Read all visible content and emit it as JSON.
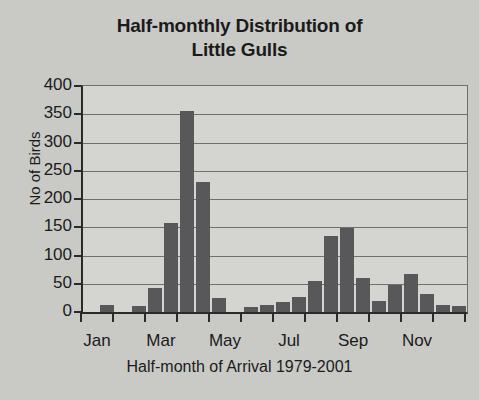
{
  "chart_data": {
    "type": "bar",
    "title": "Half-monthly Distribution of Little Gulls",
    "title_lines": [
      "Half-monthly Distribution of",
      "Little Gulls"
    ],
    "xlabel": "Half-month of Arrival 1979-2001",
    "ylabel": "No of Birds",
    "ylim": [
      0,
      400
    ],
    "ytick_labels": [
      "400",
      "350",
      "300",
      "250",
      "200",
      "150",
      "100",
      "50",
      "0"
    ],
    "ytick_values": [
      400,
      350,
      300,
      250,
      200,
      150,
      100,
      50,
      0
    ],
    "xtick_labels": [
      "Jan",
      "Mar",
      "May",
      "Jul",
      "Sep",
      "Nov"
    ],
    "xtick_months": [
      1,
      3,
      5,
      7,
      9,
      11
    ],
    "grid": true,
    "legend": null,
    "bar_color": "#58585a",
    "plot_background": "#d4d5d1",
    "figure_background": "#c9cac6",
    "axis_color": "#2a2a2a",
    "categories": [
      "Jan-1",
      "Jan-2",
      "Feb-1",
      "Feb-2",
      "Mar-1",
      "Mar-2",
      "Apr-1",
      "Apr-2",
      "May-1",
      "May-2",
      "Jun-1",
      "Jun-2",
      "Jul-1",
      "Jul-2",
      "Aug-1",
      "Aug-2",
      "Sep-1",
      "Sep-2",
      "Oct-1",
      "Oct-2",
      "Nov-1",
      "Nov-2",
      "Dec-1",
      "Dec-2"
    ],
    "values": [
      0,
      13,
      0,
      10,
      43,
      158,
      355,
      230,
      25,
      0,
      8,
      12,
      17,
      26,
      55,
      135,
      148,
      60,
      20,
      47,
      68,
      32,
      13,
      11
    ]
  }
}
